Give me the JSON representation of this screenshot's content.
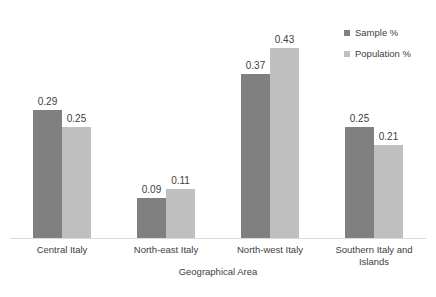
{
  "chart_data": {
    "type": "bar",
    "title": "",
    "subtitle": "",
    "xlabel": "Geographical Area",
    "ylabel": "",
    "ylim": [
      0,
      0.52
    ],
    "grid": false,
    "legend_position": "top-right",
    "categories": [
      "Central Italy",
      "North-east Italy",
      "North-west Italy",
      "Southern Italy and Islands"
    ],
    "series": [
      {
        "name": "Sample %",
        "color": "#808080",
        "values": [
          0.29,
          0.09,
          0.37,
          0.25
        ],
        "labels": [
          "0.29",
          "0.09",
          "0.37",
          "0.25"
        ]
      },
      {
        "name": "Population %",
        "color": "#bfbfbf",
        "values": [
          0.25,
          0.11,
          0.43,
          0.21
        ],
        "labels": [
          "0.25",
          "0.11",
          "0.43",
          "0.21"
        ]
      }
    ]
  },
  "axis": {
    "x_title": "Geographical Area",
    "baseline_color": "#d9d9d9"
  },
  "legend": {
    "items": [
      {
        "label": "Sample %",
        "color": "#808080"
      },
      {
        "label": "Population %",
        "color": "#bfbfbf"
      }
    ]
  }
}
